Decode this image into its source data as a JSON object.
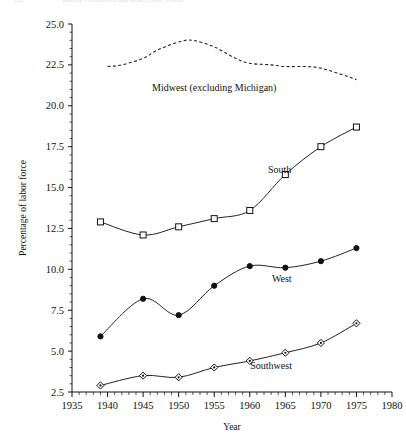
{
  "page": {
    "folio": "122",
    "running_head": "Internal Combustion and Other Labor Trends"
  },
  "chart_data": {
    "type": "line",
    "title": "",
    "xlabel": "Year",
    "ylabel": "Percentage of labor force",
    "xlim": [
      1935,
      1980
    ],
    "ylim": [
      2.5,
      25.0
    ],
    "xticks": [
      1935,
      1940,
      1945,
      1950,
      1955,
      1960,
      1965,
      1970,
      1975,
      1980
    ],
    "yticks": [
      2.5,
      5.0,
      7.5,
      10.0,
      12.5,
      15.0,
      17.5,
      20.0,
      22.5,
      25.0
    ],
    "grid": false,
    "legend": "inline-labels",
    "minor_ticks": true,
    "series": [
      {
        "name": "Midwest (excluding Michigan)",
        "label": "Midwest (excluding Michigan)",
        "style": "dashed",
        "marker": "none",
        "color": "#222222",
        "label_x": 1955.0,
        "label_y": 20.9,
        "x": [
          1940,
          1942,
          1945,
          1947,
          1950,
          1952,
          1955,
          1958,
          1960,
          1963,
          1965,
          1968,
          1970,
          1973,
          1975
        ],
        "values": [
          22.4,
          22.5,
          22.9,
          23.4,
          23.9,
          24.0,
          23.6,
          22.9,
          22.6,
          22.5,
          22.4,
          22.4,
          22.3,
          21.9,
          21.6
        ]
      },
      {
        "name": "South",
        "label": "South",
        "style": "solid",
        "marker": "open-square",
        "color": "#222222",
        "label_x": 1964.2,
        "label_y": 15.9,
        "x": [
          1939,
          1945,
          1950,
          1955,
          1960,
          1965,
          1970,
          1975
        ],
        "values": [
          12.9,
          12.1,
          12.6,
          13.1,
          13.6,
          15.8,
          17.5,
          18.7
        ]
      },
      {
        "name": "West",
        "label": "West",
        "style": "solid",
        "marker": "filled-circle",
        "color": "#222222",
        "label_x": 1964.5,
        "label_y": 9.2,
        "x": [
          1939,
          1945,
          1950,
          1955,
          1960,
          1965,
          1970,
          1975
        ],
        "values": [
          5.9,
          8.2,
          7.2,
          9.0,
          10.2,
          10.1,
          10.5,
          11.3
        ]
      },
      {
        "name": "Southwest",
        "label": "Southwest",
        "style": "solid",
        "marker": "open-diamond",
        "color": "#222222",
        "label_x": 1963.0,
        "label_y": 3.9,
        "x": [
          1939,
          1945,
          1950,
          1955,
          1960,
          1965,
          1970,
          1975
        ],
        "values": [
          2.9,
          3.5,
          3.4,
          4.0,
          4.4,
          4.9,
          5.5,
          6.7
        ]
      }
    ]
  }
}
